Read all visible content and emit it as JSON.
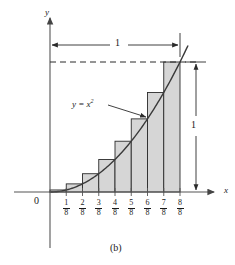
{
  "figure": {
    "caption": "(b)",
    "origin_label": "0",
    "axis_label_x": "x",
    "axis_label_y": "y",
    "curve_label_lhs": "y = x",
    "curve_label_exponent": "2",
    "dimension_horizontal_label": "1",
    "dimension_vertical_label": "1",
    "colors": {
      "bar_fill": "#d6d6d6",
      "bar_stroke": "#2b2b2b",
      "curve_stroke": "#3a3a3a",
      "axis_stroke": "#555555",
      "dimension_stroke": "#2b2b2b",
      "text": "#1a1a1a"
    },
    "tick_labels": [
      {
        "numerator": "1",
        "denominator": "8"
      },
      {
        "numerator": "2",
        "denominator": "8"
      },
      {
        "numerator": "3",
        "denominator": "8"
      },
      {
        "numerator": "4",
        "denominator": "8"
      },
      {
        "numerator": "5",
        "denominator": "8"
      },
      {
        "numerator": "6",
        "denominator": "8"
      },
      {
        "numerator": "7",
        "denominator": "8"
      },
      {
        "numerator": "8",
        "denominator": "8"
      }
    ]
  },
  "chart_data": {
    "type": "bar",
    "title": "",
    "subtitle": "",
    "xlabel": "x",
    "ylabel": "y",
    "xlim": [
      0,
      1
    ],
    "ylim": [
      0,
      1
    ],
    "grid": false,
    "legend": "none",
    "annotations": [
      {
        "text": "y = x²",
        "kind": "curve-label",
        "points_to": "curve"
      },
      {
        "text": "1",
        "kind": "dimension",
        "orientation": "horizontal",
        "spans": [
          0,
          1
        ]
      },
      {
        "text": "1",
        "kind": "dimension",
        "orientation": "vertical",
        "spans": [
          0,
          1
        ]
      },
      {
        "text": "(b)",
        "kind": "figure-caption"
      }
    ],
    "categories": [
      "1/8",
      "2/8",
      "3/8",
      "4/8",
      "5/8",
      "6/8",
      "7/8",
      "8/8"
    ],
    "bar_intervals": [
      [
        0.0,
        0.125
      ],
      [
        0.125,
        0.25
      ],
      [
        0.25,
        0.375
      ],
      [
        0.375,
        0.5
      ],
      [
        0.5,
        0.625
      ],
      [
        0.625,
        0.75
      ],
      [
        0.75,
        0.875
      ],
      [
        0.875,
        1.0
      ]
    ],
    "values": [
      0.015625,
      0.0625,
      0.140625,
      0.25,
      0.390625,
      0.5625,
      0.765625,
      1.0
    ],
    "series": [
      {
        "name": "rectangles (upper sum)",
        "values": [
          0.015625,
          0.0625,
          0.140625,
          0.25,
          0.390625,
          0.5625,
          0.765625,
          1.0
        ]
      },
      {
        "name": "y = x^2",
        "type": "line",
        "x": [
          0,
          0.125,
          0.25,
          0.375,
          0.5,
          0.625,
          0.75,
          0.875,
          1.0,
          1.06
        ],
        "values": [
          0,
          0.015625,
          0.0625,
          0.140625,
          0.25,
          0.390625,
          0.5625,
          0.765625,
          1.0,
          1.1236
        ]
      }
    ],
    "tick_values": [
      0.125,
      0.25,
      0.375,
      0.5,
      0.625,
      0.75,
      0.875,
      1.0
    ],
    "tick_labels": [
      "1/8",
      "2/8",
      "3/8",
      "4/8",
      "5/8",
      "6/8",
      "7/8",
      "8/8"
    ]
  }
}
